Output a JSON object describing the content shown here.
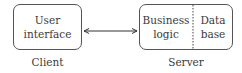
{
  "diagram": {
    "client": {
      "box_label_line1": "User",
      "box_label_line2": "interface",
      "caption": "Client"
    },
    "server": {
      "left_label_line1": "Business",
      "left_label_line2": "logic",
      "right_label_line1": "Data",
      "right_label_line2": "base",
      "caption": "Server"
    },
    "connector": "bidirectional-arrow"
  }
}
